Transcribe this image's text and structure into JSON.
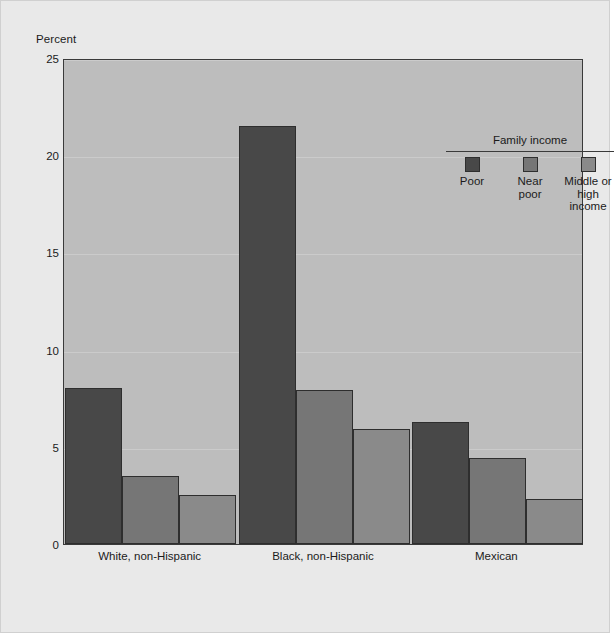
{
  "figure": {
    "background_color": "#e9e9e9",
    "plot_background_color": "#bdbdbd",
    "axis_color": "#3a3a3a"
  },
  "chart_data": {
    "type": "bar",
    "title": "",
    "subtitle": "",
    "xlabel": "",
    "ylabel": "Percent",
    "ylim": [
      0,
      25
    ],
    "yticks": [
      0,
      5,
      10,
      15,
      20,
      25
    ],
    "ytick_labels": [
      "0",
      "5",
      "10",
      "15",
      "20",
      "25"
    ],
    "grid": true,
    "legend_title": "Family income",
    "legend_position": "upper right inside",
    "categories": [
      "White, non-Hispanic",
      "Black, non-Hispanic",
      "Mexican"
    ],
    "series": [
      {
        "name": "Poor",
        "color": "#484848",
        "values": [
          8.0,
          21.5,
          6.3
        ]
      },
      {
        "name": "Near poor",
        "color": "#767676",
        "values": [
          3.5,
          7.9,
          4.4
        ]
      },
      {
        "name": "Middle or high income",
        "color": "#8a8a8a",
        "values": [
          2.5,
          5.9,
          2.3
        ]
      }
    ]
  },
  "legend": {
    "title": "Family income",
    "entries": [
      {
        "label": "Poor",
        "color": "#484848"
      },
      {
        "label": "Near\npoor",
        "color": "#767676"
      },
      {
        "label": "Middle or\nhigh income",
        "color": "#8a8a8a"
      }
    ]
  }
}
